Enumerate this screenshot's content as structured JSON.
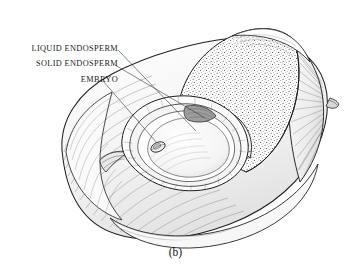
{
  "figure": {
    "caption": "(b)",
    "background_color": "#ffffff",
    "ink_color": "#1b1b1b"
  },
  "callouts": [
    {
      "id": "liquid-endosperm",
      "label": "LIQUID ENDOSPERM",
      "leader": {
        "x1": 118,
        "y1": 50,
        "x2": 196,
        "y2": 131
      }
    },
    {
      "id": "solid-endosperm",
      "label": "SOLID ENDOSPERM",
      "leader": {
        "x1": 115,
        "y1": 65,
        "x2": 205,
        "y2": 118
      }
    },
    {
      "id": "embryo",
      "label": "EMBRYO",
      "leader": {
        "x1": 103,
        "y1": 81,
        "x2": 157,
        "y2": 143
      }
    }
  ],
  "parts": {
    "husk": "fibrous-outer-husk",
    "shell": "hard-inner-shell",
    "solid_endosperm": "stippled-coconut-meat",
    "cavity": "hollow-liquid-cavity",
    "embryo": "small-oval-embryo"
  }
}
